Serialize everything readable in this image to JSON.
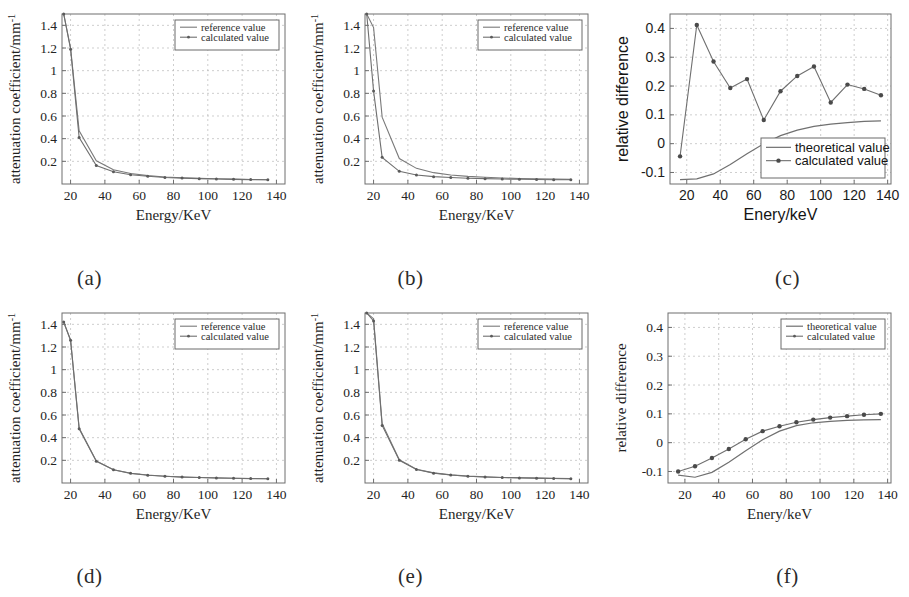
{
  "figure": {
    "panels": [
      {
        "id": "a",
        "label": "(a)",
        "xlabel": "Energy/KeV",
        "ylabel": "attenuation coefficient/mm",
        "ylabel_sup": "-1",
        "legend": [
          "reference value",
          "calculated value"
        ],
        "font": "serif"
      },
      {
        "id": "b",
        "label": "(b)",
        "xlabel": "Energy/KeV",
        "ylabel": "attenuation coefficient/mm",
        "ylabel_sup": "-1",
        "legend": [
          "reference value",
          "calculated value"
        ],
        "font": "serif"
      },
      {
        "id": "c",
        "label": "(c)",
        "xlabel": "Enery/keV",
        "ylabel": "relative difference",
        "ylabel_sup": "",
        "legend": [
          "theoretical value",
          "calculated value"
        ],
        "font": "sans"
      },
      {
        "id": "d",
        "label": "(d)",
        "xlabel": "Energy/KeV",
        "ylabel": "attenuation coefficient/mm",
        "ylabel_sup": "-1",
        "legend": [
          "reference value",
          "calculated value"
        ],
        "font": "serif"
      },
      {
        "id": "e",
        "label": "(e)",
        "xlabel": "Energy/KeV",
        "ylabel": "attenuation coefficient/mm",
        "ylabel_sup": "-1",
        "legend": [
          "reference value",
          "calculated value"
        ],
        "font": "serif"
      },
      {
        "id": "f",
        "label": "(f)",
        "xlabel": "Enery/keV",
        "ylabel": "relative difference",
        "ylabel_sup": "",
        "legend": [
          "theoretical value",
          "calculated value"
        ],
        "font": "serif"
      }
    ]
  },
  "chart_data": [
    {
      "type": "line",
      "panel": "a",
      "title": "",
      "xlabel": "Energy/KeV",
      "ylabel": "attenuation coefficient/mm-1",
      "xlim": [
        15,
        145
      ],
      "ylim": [
        0,
        1.5
      ],
      "xticks": [
        20,
        40,
        60,
        80,
        100,
        120,
        140
      ],
      "yticks": [
        0.2,
        0.4,
        0.6,
        0.8,
        1,
        1.2,
        1.4
      ],
      "grid": true,
      "legend": "upper right",
      "x": [
        16,
        20,
        25,
        35,
        45,
        55,
        65,
        75,
        85,
        95,
        105,
        115,
        125,
        135
      ],
      "series": [
        {
          "name": "reference value",
          "style": "line",
          "values": [
            1.5,
            1.2,
            0.47,
            0.205,
            0.125,
            0.092,
            0.074,
            0.062,
            0.055,
            0.05,
            0.046,
            0.043,
            0.04,
            0.038
          ]
        },
        {
          "name": "calculated value",
          "style": "line+marker",
          "values": [
            1.5,
            1.19,
            0.41,
            0.163,
            0.108,
            0.082,
            0.068,
            0.058,
            0.052,
            0.047,
            0.044,
            0.041,
            0.039,
            0.037
          ]
        }
      ]
    },
    {
      "type": "line",
      "panel": "b",
      "title": "",
      "xlabel": "Energy/KeV",
      "ylabel": "attenuation coefficient/mm-1",
      "xlim": [
        15,
        145
      ],
      "ylim": [
        0,
        1.5
      ],
      "xticks": [
        20,
        40,
        60,
        80,
        100,
        120,
        140
      ],
      "yticks": [
        0.2,
        0.4,
        0.6,
        0.8,
        1,
        1.2,
        1.4
      ],
      "grid": true,
      "legend": "upper right",
      "x": [
        16,
        20,
        25,
        35,
        45,
        55,
        65,
        75,
        85,
        95,
        105,
        115,
        125,
        135
      ],
      "series": [
        {
          "name": "reference value",
          "style": "line",
          "values": [
            1.5,
            1.38,
            0.59,
            0.225,
            0.138,
            0.1,
            0.08,
            0.067,
            0.059,
            0.053,
            0.049,
            0.046,
            0.043,
            0.041
          ]
        },
        {
          "name": "calculated value",
          "style": "line+marker",
          "values": [
            1.5,
            0.82,
            0.235,
            0.112,
            0.08,
            0.065,
            0.057,
            0.051,
            0.047,
            0.044,
            0.042,
            0.04,
            0.038,
            0.037
          ]
        }
      ]
    },
    {
      "type": "line",
      "panel": "c",
      "title": "",
      "xlabel": "Enery/keV",
      "ylabel": "relative difference",
      "xlim": [
        10,
        142
      ],
      "ylim": [
        -0.14,
        0.45
      ],
      "xticks": [
        20,
        40,
        60,
        80,
        100,
        120,
        140
      ],
      "yticks": [
        -0.1,
        0,
        0.1,
        0.2,
        0.3,
        0.4
      ],
      "grid": true,
      "legend": "lower right",
      "x": [
        16,
        26,
        36,
        46,
        56,
        66,
        76,
        86,
        96,
        106,
        116,
        126,
        136
      ],
      "series": [
        {
          "name": "theoretical value",
          "style": "line",
          "values": [
            -0.125,
            -0.122,
            -0.105,
            -0.072,
            -0.035,
            0.0,
            0.028,
            0.047,
            0.06,
            0.068,
            0.073,
            0.077,
            0.079
          ]
        },
        {
          "name": "calculated value",
          "style": "line+marker",
          "values": [
            -0.044,
            0.412,
            0.285,
            0.193,
            0.224,
            0.082,
            0.182,
            0.235,
            0.268,
            0.143,
            0.205,
            0.19,
            0.168
          ]
        }
      ]
    },
    {
      "type": "line",
      "panel": "d",
      "title": "",
      "xlabel": "Energy/KeV",
      "ylabel": "attenuation coefficient/mm-1",
      "xlim": [
        15,
        145
      ],
      "ylim": [
        0,
        1.5
      ],
      "xticks": [
        20,
        40,
        60,
        80,
        100,
        120,
        140
      ],
      "yticks": [
        0.2,
        0.4,
        0.6,
        0.8,
        1,
        1.2,
        1.4
      ],
      "grid": true,
      "legend": "upper right",
      "x": [
        16,
        20,
        25,
        35,
        45,
        55,
        65,
        75,
        85,
        95,
        105,
        115,
        125,
        135
      ],
      "series": [
        {
          "name": "reference value",
          "style": "line",
          "values": [
            1.42,
            1.26,
            0.485,
            0.195,
            0.117,
            0.086,
            0.07,
            0.06,
            0.053,
            0.048,
            0.045,
            0.042,
            0.04,
            0.038
          ]
        },
        {
          "name": "calculated value",
          "style": "line+marker",
          "values": [
            1.42,
            1.26,
            0.478,
            0.192,
            0.116,
            0.085,
            0.069,
            0.059,
            0.052,
            0.048,
            0.044,
            0.042,
            0.039,
            0.038
          ]
        }
      ]
    },
    {
      "type": "line",
      "panel": "e",
      "title": "",
      "xlabel": "Energy/KeV",
      "ylabel": "attenuation coefficient/mm-1",
      "xlim": [
        15,
        145
      ],
      "ylim": [
        0,
        1.5
      ],
      "xticks": [
        20,
        40,
        60,
        80,
        100,
        120,
        140
      ],
      "yticks": [
        0.2,
        0.4,
        0.6,
        0.8,
        1,
        1.2,
        1.4
      ],
      "grid": true,
      "legend": "upper right",
      "x": [
        16,
        20,
        25,
        35,
        45,
        55,
        65,
        75,
        85,
        95,
        105,
        115,
        125,
        135
      ],
      "series": [
        {
          "name": "reference value",
          "style": "line",
          "values": [
            1.5,
            1.45,
            0.525,
            0.205,
            0.122,
            0.089,
            0.072,
            0.061,
            0.054,
            0.049,
            0.046,
            0.043,
            0.041,
            0.039
          ]
        },
        {
          "name": "calculated value",
          "style": "line+marker",
          "values": [
            1.5,
            1.43,
            0.508,
            0.2,
            0.119,
            0.087,
            0.071,
            0.06,
            0.053,
            0.049,
            0.045,
            0.043,
            0.04,
            0.038
          ]
        }
      ]
    },
    {
      "type": "line",
      "panel": "f",
      "title": "",
      "xlabel": "Enery/keV",
      "ylabel": "relative difference",
      "xlim": [
        10,
        142
      ],
      "ylim": [
        -0.14,
        0.45
      ],
      "xticks": [
        20,
        40,
        60,
        80,
        100,
        120,
        140
      ],
      "yticks": [
        -0.1,
        0,
        0.1,
        0.2,
        0.3,
        0.4
      ],
      "grid": true,
      "legend": "upper right",
      "x": [
        16,
        26,
        36,
        46,
        56,
        66,
        76,
        86,
        96,
        106,
        116,
        126,
        136
      ],
      "series": [
        {
          "name": "theoretical value",
          "style": "line",
          "values": [
            -0.113,
            -0.12,
            -0.103,
            -0.068,
            -0.028,
            0.01,
            0.04,
            0.059,
            0.069,
            0.074,
            0.077,
            0.079,
            0.08
          ]
        },
        {
          "name": "calculated value",
          "style": "line+marker",
          "values": [
            -0.1,
            -0.082,
            -0.053,
            -0.022,
            0.012,
            0.04,
            0.057,
            0.071,
            0.08,
            0.087,
            0.092,
            0.097,
            0.1
          ]
        }
      ]
    }
  ]
}
